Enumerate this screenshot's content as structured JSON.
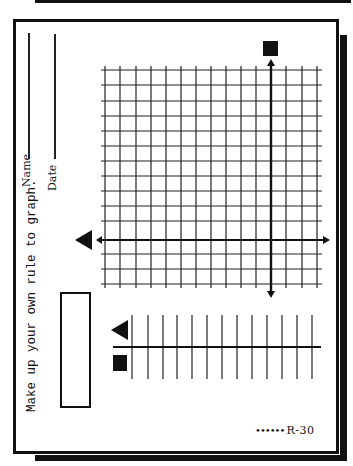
{
  "worksheet": {
    "name_label": "Name",
    "date_label": "Date",
    "instruction": "Make up your own rule to graph.",
    "page_code": "R-30",
    "footer_dots": "••••••"
  },
  "graph": {
    "grid": {
      "vertical_lines": 15,
      "horizontal_lines": 15,
      "x_left": 105,
      "x_right": 318,
      "y_top": 70,
      "y_bottom": 284
    },
    "x_axis": {
      "y": 240,
      "x_start": 96,
      "x_end": 328,
      "input_symbol": "triangle"
    },
    "y_axis": {
      "x": 271,
      "y_start": 60,
      "y_end": 297,
      "output_symbol": "square"
    }
  },
  "table": {
    "row_symbols": [
      "triangle",
      "square"
    ],
    "columns": 12,
    "line_color": "#222222"
  },
  "colors": {
    "ink": "#111111",
    "paper": "#ffffff"
  }
}
